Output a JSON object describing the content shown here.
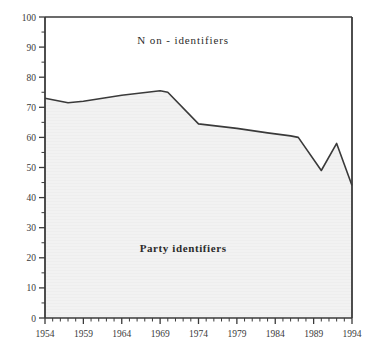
{
  "chart_data": {
    "type": "area",
    "title": "",
    "subtitle": "",
    "xlabel": "",
    "ylabel": "",
    "xlim": [
      1954,
      1994
    ],
    "ylim": [
      0,
      100
    ],
    "grid": false,
    "legend_position": "inside-annotations",
    "x_ticks": [
      1954,
      1959,
      1964,
      1969,
      1974,
      1979,
      1984,
      1989,
      1994
    ],
    "x_tick_labels": [
      "1954",
      "1959",
      "1964",
      "1969",
      "1974",
      "1979",
      "1984",
      "1989",
      "1994"
    ],
    "x_minor_tick_step": 1,
    "y_ticks": [
      0,
      10,
      20,
      30,
      40,
      50,
      60,
      70,
      80,
      90,
      100
    ],
    "y_tick_labels": [
      "0",
      "10",
      "20",
      "30",
      "40",
      "50",
      "60",
      "70",
      "80",
      "90",
      "100"
    ],
    "y_minor_tick_step": 5,
    "annotations": [
      {
        "name": "non-identifiers",
        "text": "N on - identifiers",
        "x": 1972,
        "y": 91,
        "bold": false
      },
      {
        "name": "party-identifiers",
        "text": "Party identifiers",
        "x": 1972,
        "y": 22,
        "bold": true
      }
    ],
    "series": [
      {
        "name": "Party identifiers",
        "fill_color": "#f2f2f2",
        "line_color": "#3a3a3a",
        "x": [
          1954,
          1957,
          1959,
          1964,
          1969,
          1970,
          1974,
          1979,
          1983,
          1986,
          1987,
          1990,
          1992,
          1994
        ],
        "values": [
          73,
          71.5,
          72,
          74,
          75.5,
          75,
          64.5,
          63,
          61.5,
          60.5,
          60,
          49,
          58,
          44
        ]
      }
    ],
    "colors": {
      "axis": "#3a3a3a",
      "line": "#3a3a3a",
      "fill": "#f2f2f2",
      "text": "#2b2b2b",
      "background": "#ffffff"
    }
  }
}
